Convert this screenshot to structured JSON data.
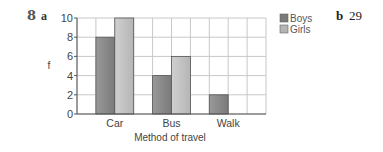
{
  "question": {
    "number": "8",
    "part_a": "a",
    "part_b": "b",
    "part_b_answer": "29"
  },
  "colors": {
    "boys": "#7a7a7a",
    "girls": "#b5b5b5",
    "grid": "#c8c8c8",
    "axis": "#555555"
  },
  "chart_data": {
    "type": "bar",
    "title": "",
    "xlabel": "Method of travel",
    "ylabel": "f",
    "categories": [
      "Car",
      "Bus",
      "Walk"
    ],
    "series": [
      {
        "name": "Boys",
        "values": [
          8,
          4,
          2
        ]
      },
      {
        "name": "Girls",
        "values": [
          10,
          6,
          0
        ]
      }
    ],
    "ylim": [
      0,
      10
    ],
    "yticks": [
      0,
      2,
      4,
      6,
      8,
      10
    ],
    "grid": true,
    "legend": "right"
  }
}
